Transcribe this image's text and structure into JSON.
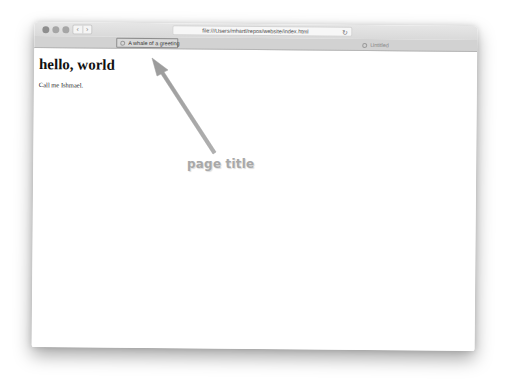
{
  "browser": {
    "nav": {
      "back_glyph": "‹",
      "forward_glyph": "›"
    },
    "url": "file:///Users/mhartl/repos/website/index.html",
    "reload_glyph": "↻",
    "tabs": [
      {
        "label": "A whale of a greeting",
        "icon": "page-icon",
        "active": true
      },
      {
        "label": "Untitled",
        "icon": "page-icon",
        "active": false
      }
    ]
  },
  "page": {
    "heading": "hello, world",
    "paragraph": "Call me Ishmael."
  },
  "annotation": {
    "label": "page title",
    "color": "#a8a8a8"
  }
}
